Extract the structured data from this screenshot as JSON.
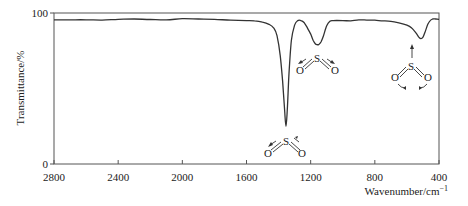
{
  "chart_data": {
    "type": "line",
    "title": "",
    "xlabel": "Wavenumber/cm⁻¹",
    "ylabel": "Transmittance/%",
    "xlim": [
      2800,
      400
    ],
    "ylim": [
      0,
      100
    ],
    "x_reversed": true,
    "grid": false,
    "legend": null,
    "xticks": [
      2800,
      2400,
      2000,
      1600,
      1200,
      800,
      400
    ],
    "yticks": [
      0,
      100
    ],
    "series": [
      {
        "name": "SO2 IR spectrum",
        "x": [
          2800,
          2700,
          2600,
          2500,
          2400,
          2300,
          2200,
          2100,
          2000,
          1900,
          1800,
          1700,
          1600,
          1550,
          1500,
          1460,
          1430,
          1410,
          1390,
          1375,
          1362,
          1354,
          1346,
          1335,
          1320,
          1300,
          1280,
          1260,
          1240,
          1220,
          1200,
          1185,
          1170,
          1160,
          1154,
          1148,
          1135,
          1120,
          1100,
          1080,
          1060,
          1000,
          950,
          900,
          850,
          800,
          750,
          700,
          650,
          600,
          570,
          545,
          525,
          512,
          500,
          485,
          470,
          455,
          440,
          420,
          400
        ],
        "y": [
          95.5,
          95.5,
          95.5,
          95.3,
          95.8,
          96.0,
          95.7,
          95.5,
          96.2,
          96.0,
          95.8,
          95.2,
          95.0,
          94.8,
          94.0,
          92.5,
          90.0,
          85.0,
          72.0,
          55.0,
          35.0,
          25.0,
          35.0,
          60.0,
          82.0,
          92.0,
          95.0,
          95.0,
          93.5,
          90.0,
          86.0,
          82.0,
          79.5,
          79.0,
          79.0,
          79.2,
          81.0,
          85.0,
          91.5,
          94.5,
          95.0,
          95.0,
          94.8,
          95.5,
          95.3,
          95.2,
          94.8,
          94.5,
          93.5,
          92.0,
          90.0,
          87.0,
          84.0,
          83.0,
          84.0,
          88.0,
          92.5,
          95.0,
          96.0,
          96.0,
          95.8
        ]
      }
    ],
    "peaks": [
      {
        "wavenumber": 1354,
        "transmittance": 25,
        "assignment": "SO2 asymmetric stretch"
      },
      {
        "wavenumber": 1154,
        "transmittance": 79,
        "assignment": "SO2 symmetric stretch"
      },
      {
        "wavenumber": 512,
        "transmittance": 83,
        "assignment": "SO2 bending"
      }
    ],
    "annotations": [
      {
        "type": "molecule",
        "atoms": [
          "O",
          "S",
          "O"
        ],
        "mode": "asymmetric-stretch",
        "near_wavenumber": 1354
      },
      {
        "type": "molecule",
        "atoms": [
          "O",
          "S",
          "O"
        ],
        "mode": "symmetric-stretch",
        "near_wavenumber": 1154
      },
      {
        "type": "molecule",
        "atoms": [
          "O",
          "S",
          "O"
        ],
        "mode": "bending",
        "near_wavenumber": 512
      }
    ]
  },
  "labels": {
    "y_axis": "Transmittance/%",
    "x_axis_main": "Wavenumber/cm",
    "x_axis_sup": "−1",
    "y_top": "100",
    "y_bottom": "0",
    "x_ticks": [
      "2800",
      "2400",
      "2000",
      "1600",
      "1200",
      "800",
      "400"
    ],
    "atom_s": "S",
    "atom_o": "O"
  }
}
